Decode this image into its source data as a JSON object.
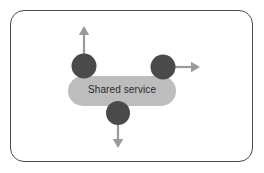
{
  "diagram": {
    "type": "architecture-diagram",
    "frame": {
      "name": "diagram-border",
      "shape": "rounded-rectangle",
      "stroke_color": "#4b4b4b",
      "fill_color": "#ffffff"
    },
    "service": {
      "label": "Shared service",
      "shape": "rounded-rectangle-pill",
      "fill_color": "#bdbdbd",
      "text_color": "#2b2b2b"
    },
    "nodes": [
      {
        "id": "node-top-left",
        "shape": "circle",
        "fill_color": "#4a4a4a",
        "position": "top-left",
        "arrow_direction": "up",
        "arrow_color": "#9a9a9a"
      },
      {
        "id": "node-right",
        "shape": "circle",
        "fill_color": "#4a4a4a",
        "position": "top-right",
        "arrow_direction": "right",
        "arrow_color": "#9a9a9a"
      },
      {
        "id": "node-bottom",
        "shape": "circle",
        "fill_color": "#4a4a4a",
        "position": "bottom-center",
        "arrow_direction": "down",
        "arrow_color": "#9a9a9a"
      }
    ],
    "colors": {
      "node_fill": "#4a4a4a",
      "service_fill": "#bdbdbd",
      "arrow": "#9a9a9a",
      "border": "#4b4b4b",
      "background": "#ffffff",
      "text": "#2b2b2b"
    }
  }
}
